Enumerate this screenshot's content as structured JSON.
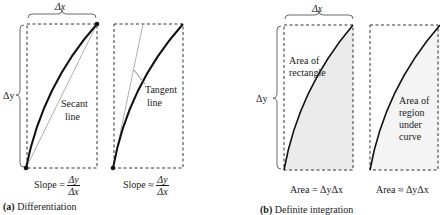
{
  "colors": {
    "ink": "#1a1a1a",
    "secant_line": "#9a9a9a",
    "shade_rect": "#ebebeb",
    "shade_region": "#f3f3f3",
    "dashed_box": "#333333"
  },
  "part_a": {
    "caption_letter": "(a)",
    "caption_text": "Differentiation",
    "delta_x": "Δx",
    "delta_y": "Δy",
    "panel1": {
      "line_label_1": "Secant",
      "line_label_2": "line",
      "formula_prefix": "Slope =",
      "num": "Δy",
      "den": "Δx"
    },
    "panel2": {
      "line_label_1": "Tangent",
      "line_label_2": "line",
      "formula_prefix": "Slope ≈",
      "num": "Δy",
      "den": "Δx"
    }
  },
  "part_b": {
    "caption_letter": "(b)",
    "caption_text": "Definite integration",
    "delta_x": "Δx",
    "delta_y": "Δy",
    "panel1": {
      "area_label_1": "Area of",
      "area_label_2": "rectangle",
      "formula": "Area = ΔyΔx"
    },
    "panel2": {
      "area_label_1": "Area of",
      "area_label_2": "region",
      "area_label_3": "under",
      "area_label_4": "curve",
      "formula": "Area ≈ ΔyΔx"
    }
  }
}
